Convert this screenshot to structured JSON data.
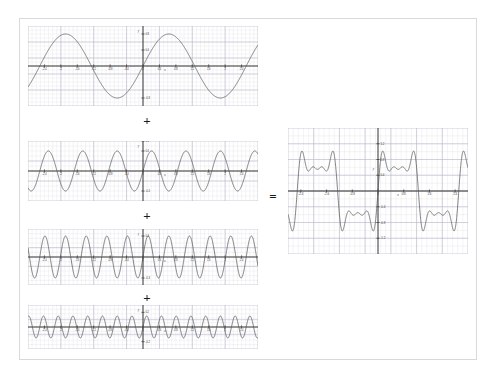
{
  "figure": {
    "background_color": "#ffffff",
    "frame_color": "#d9d9d9",
    "curve_color": "#555555",
    "axis_color": "#333333",
    "grid_major_color": "#b9b9c9",
    "grid_minor_color": "#e4e4ec",
    "operators": {
      "plus_1": "+",
      "plus_2": "+",
      "plus_3": "+",
      "equals": "="
    }
  },
  "chart_data": [
    {
      "id": "harmonic-1",
      "type": "line",
      "title": "",
      "xlabel": "x",
      "ylabel": "y",
      "xlim": [
        -2.8,
        2.8
      ],
      "ylim": [
        -1.0,
        1.0
      ],
      "grid": true,
      "legend": "none",
      "series": [
        {
          "name": "0.8 sin(2.5 x)",
          "amplitude": 0.8,
          "frequency": 2.5,
          "phase": 0,
          "function": "y = 0.8*sin(2.5*x)"
        }
      ],
      "xticks": [
        -2.4,
        -2.0,
        -1.6,
        -1.2,
        -0.8,
        -0.4,
        0,
        0.4,
        0.8,
        1.2,
        1.6,
        2.0,
        2.4
      ],
      "xticklabels": [
        "-2.4",
        "-2",
        "-1.6",
        "-1.2",
        "-0.8",
        "-0.4",
        "0",
        "0.4",
        "0.8",
        "1.2",
        "1.6",
        "2",
        "2.4"
      ],
      "yticks": [
        -0.8,
        0.4,
        0.8
      ],
      "yticklabels": [
        "-0.8",
        "0.4",
        "0.8"
      ]
    },
    {
      "id": "harmonic-2",
      "type": "line",
      "title": "",
      "xlabel": "x",
      "ylabel": "y",
      "xlim": [
        -2.8,
        2.8
      ],
      "ylim": [
        -0.6,
        0.6
      ],
      "grid": true,
      "legend": "none",
      "series": [
        {
          "name": "0.4 sin(7.5 x)",
          "amplitude": 0.4,
          "frequency": 7.5,
          "phase": 0,
          "function": "y = 0.4*sin(7.5*x)"
        }
      ],
      "xticks": [
        -2.4,
        -2.0,
        -1.6,
        -1.2,
        -0.8,
        -0.4,
        0,
        0.4,
        0.8,
        1.2,
        1.6,
        2.0,
        2.4
      ],
      "xticklabels": [
        "-2.4",
        "-2",
        "-1.6",
        "-1.2",
        "-0.8",
        "-0.4",
        "0",
        "0.4",
        "0.8",
        "1.2",
        "1.6",
        "2",
        "2.4"
      ],
      "yticks": [
        -0.4,
        0.4,
        0.6
      ],
      "yticklabels": [
        "-0.4",
        "0.4",
        "0.6"
      ]
    },
    {
      "id": "harmonic-3",
      "type": "line",
      "title": "",
      "xlabel": "x",
      "ylabel": "y",
      "xlim": [
        -2.8,
        2.8
      ],
      "ylim": [
        -0.4,
        0.4
      ],
      "grid": true,
      "legend": "none",
      "series": [
        {
          "name": "0.3 sin(12.5 x)",
          "amplitude": 0.3,
          "frequency": 12.5,
          "phase": 0,
          "function": "y = 0.3*sin(12.5*x)"
        }
      ],
      "xticks": [
        -2.4,
        -2.0,
        -1.6,
        -1.2,
        -0.8,
        -0.4,
        0,
        0.4,
        0.8,
        1.2,
        1.6,
        2.0,
        2.4
      ],
      "xticklabels": [
        "-2.4",
        "-2",
        "-1.6",
        "-1.2",
        "-0.8",
        "-0.4",
        "0",
        "0.4",
        "0.8",
        "1.2",
        "1.6",
        "2",
        "2.4"
      ],
      "yticks": [
        -0.3,
        0.3
      ],
      "yticklabels": [
        "-0.3",
        "0.3"
      ]
    },
    {
      "id": "harmonic-4",
      "type": "line",
      "title": "",
      "xlabel": "x",
      "ylabel": "y",
      "xlim": [
        -2.8,
        2.8
      ],
      "ylim": [
        -0.3,
        0.3
      ],
      "grid": true,
      "legend": "none",
      "series": [
        {
          "name": "0.15 sin(17.5 x)",
          "amplitude": 0.15,
          "frequency": 17.5,
          "phase": 0,
          "function": "y = 0.15*sin(17.5*x)"
        }
      ],
      "xticks": [
        -2.4,
        -2.0,
        -1.6,
        -1.2,
        -0.8,
        -0.4,
        0,
        0.4,
        0.8,
        1.2,
        1.6,
        2.0,
        2.4
      ],
      "xticklabels": [
        "-2.4",
        "-2",
        "-1.6",
        "-1.2",
        "-0.8",
        "-0.4",
        "0",
        "0.4",
        "0.8",
        "1.2",
        "1.6",
        "2",
        "2.4"
      ],
      "yticks": [
        -0.2,
        0.2
      ],
      "yticklabels": [
        "-0.2",
        "0.2"
      ]
    },
    {
      "id": "sum-result",
      "type": "line",
      "title": "",
      "xlabel": "x",
      "ylabel": "y",
      "xlim": [
        -2.8,
        2.8
      ],
      "ylim": [
        -1.6,
        1.6
      ],
      "grid": true,
      "legend": "none",
      "series": [
        {
          "name": "sum of harmonics",
          "function": "y = 0.8*sin(2.5*x) + 0.4*sin(7.5*x) + 0.3*sin(12.5*x) + 0.15*sin(17.5*x)"
        }
      ],
      "xticks": [
        -2.4,
        -1.6,
        -0.8,
        0,
        0.8,
        1.6,
        2.4
      ],
      "xticklabels": [
        "-2.4",
        "-1.6",
        "-0.8",
        "0",
        "0.8",
        "1.6",
        "2.4"
      ],
      "yticks": [
        -1.2,
        -0.8,
        -0.4,
        0.4,
        0.8,
        1.2
      ],
      "yticklabels": [
        "-1.2",
        "-0.8",
        "-0.4",
        "0.4",
        "0.8",
        "1.2"
      ]
    }
  ]
}
